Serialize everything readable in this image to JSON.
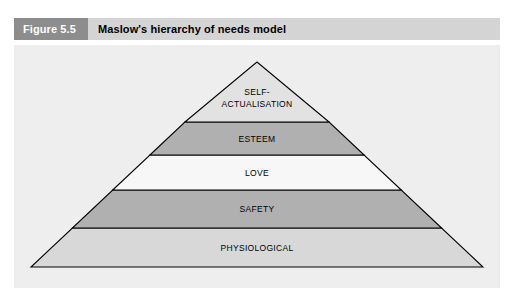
{
  "header": {
    "figure_number": "Figure 5.5",
    "title": "Maslow's hierarchy of needs model"
  },
  "colors": {
    "figure_number_bg": "#8d8d8d",
    "figure_number_text": "#ffffff",
    "title_bg": "#d4d4d4",
    "title_text": "#000000",
    "panel_bg": "#eeeeee",
    "pyramid_outline": "#000000",
    "band_light": "#e2e2e2",
    "band_dark": "#b0b0b0",
    "band_white": "#f7f7f7",
    "band_medium": "#d8d8d8"
  },
  "diagram": {
    "name": "maslow-hierarchy-pyramid",
    "shape": "pyramid",
    "level_count": 5,
    "levels": [
      {
        "rank": 1,
        "label": "SELF-\nACTUALISATION",
        "label_lines": [
          "SELF-",
          "ACTUALISATION"
        ],
        "fill": "#e2e2e2"
      },
      {
        "rank": 2,
        "label": "ESTEEM",
        "label_lines": [
          "ESTEEM"
        ],
        "fill": "#b0b0b0"
      },
      {
        "rank": 3,
        "label": "LOVE",
        "label_lines": [
          "LOVE"
        ],
        "fill": "#f7f7f7"
      },
      {
        "rank": 4,
        "label": "SAFETY",
        "label_lines": [
          "SAFETY"
        ],
        "fill": "#b0b0b0"
      },
      {
        "rank": 5,
        "label": "PHYSIOLOGICAL",
        "label_lines": [
          "PHYSIOLOGICAL"
        ],
        "fill": "#d8d8d8"
      }
    ]
  }
}
